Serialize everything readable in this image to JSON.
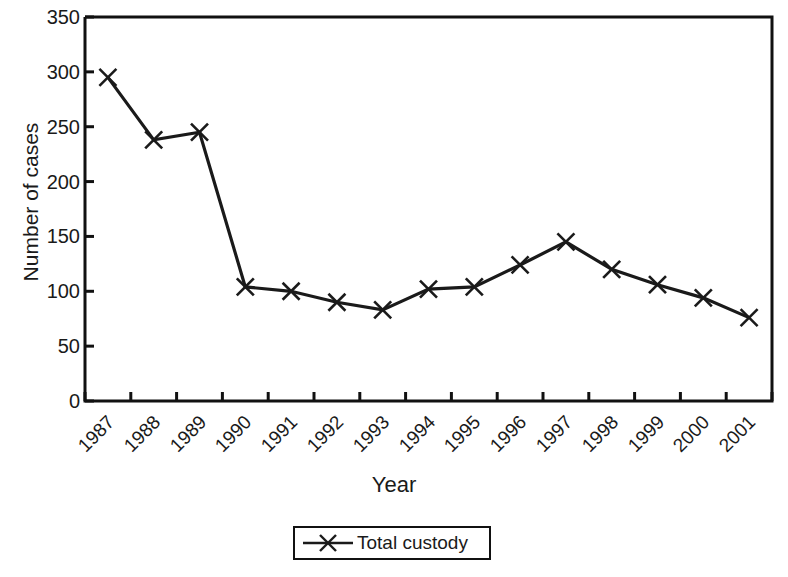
{
  "chart_data": {
    "type": "line",
    "title": "",
    "xlabel": "Year",
    "ylabel": "Number of cases",
    "categories": [
      "1987",
      "1988",
      "1989",
      "1990",
      "1991",
      "1992",
      "1993",
      "1994",
      "1995",
      "1996",
      "1997",
      "1998",
      "1999",
      "2000",
      "2001"
    ],
    "series": [
      {
        "name": "Total custody",
        "marker": "x-cross",
        "color": "#1a1a1a",
        "values": [
          295,
          238,
          245,
          104,
          100,
          90,
          83,
          102,
          104,
          124,
          145,
          120,
          106,
          94,
          76
        ]
      }
    ],
    "ylim": [
      0,
      350
    ],
    "y_ticks": [
      0,
      50,
      100,
      150,
      200,
      250,
      300,
      350
    ],
    "y_tick_labels": [
      "0",
      "50",
      "100",
      "150",
      "200",
      "250",
      "300",
      "350"
    ],
    "x_tick_labels": [
      "1987",
      "1988",
      "1989",
      "1990",
      "1991",
      "1992",
      "1993",
      "1994",
      "1995",
      "1996",
      "1997",
      "1998",
      "1999",
      "2000",
      "2001"
    ],
    "grid": false,
    "legend_position": "bottom-center",
    "legend_entries": [
      "Total custody"
    ],
    "axis_color": "#111111",
    "background": "#ffffff"
  },
  "legend": {
    "label": "Total custody"
  },
  "axes": {
    "x_title": "Year",
    "y_title": "Number of cases"
  }
}
